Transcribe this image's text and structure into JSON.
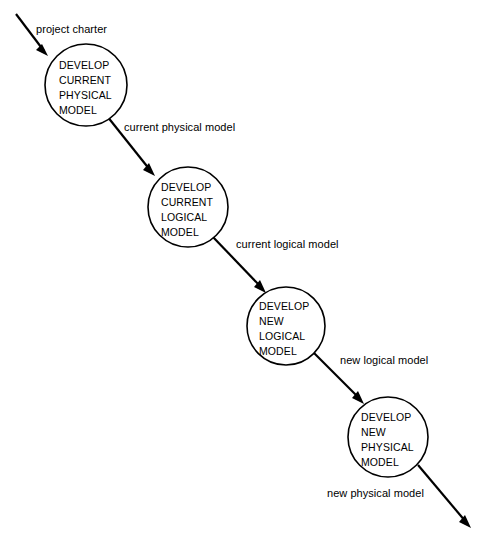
{
  "diagram": {
    "type": "data-flow-diagram",
    "background_color": "#ffffff",
    "stroke_color": "#000000",
    "processes": [
      {
        "id": "develop-current-physical-model",
        "lines": [
          "DEVELOP",
          "CURRENT",
          "PHYSICAL",
          "MODEL"
        ],
        "cx": 86,
        "cy": 85,
        "r": 41
      },
      {
        "id": "develop-current-logical-model",
        "lines": [
          "DEVELOP",
          "CURRENT",
          "LOGICAL",
          "MODEL"
        ],
        "cx": 188,
        "cy": 207,
        "r": 40
      },
      {
        "id": "develop-new-logical-model",
        "lines": [
          "DEVELOP",
          "NEW",
          "LOGICAL",
          "MODEL"
        ],
        "cx": 286,
        "cy": 326,
        "r": 39
      },
      {
        "id": "develop-new-physical-model",
        "lines": [
          "DEVELOP",
          "NEW",
          "PHYSICAL",
          "MODEL"
        ],
        "cx": 388,
        "cy": 437,
        "r": 40
      }
    ],
    "flows": [
      {
        "id": "project-charter",
        "label": "project charter",
        "label_x": 36,
        "label_y": 33,
        "x1": 16,
        "y1": 14,
        "x2": 48,
        "y2": 56
      },
      {
        "id": "current-physical-model",
        "label": "current physical model",
        "label_x": 124,
        "label_y": 131,
        "x1": 107,
        "y1": 116,
        "x2": 155,
        "y2": 176
      },
      {
        "id": "current-logical-model",
        "label": "current logical model",
        "label_x": 236,
        "label_y": 248,
        "x1": 212,
        "y1": 236,
        "x2": 266,
        "y2": 293
      },
      {
        "id": "new-logical-model",
        "label": "new logical model",
        "label_x": 340,
        "label_y": 364,
        "x1": 312,
        "y1": 351,
        "x2": 364,
        "y2": 404
      },
      {
        "id": "new-physical-model",
        "label": "new physical model",
        "label_x": 327,
        "label_y": 497,
        "x1": 418,
        "y1": 465,
        "x2": 471,
        "y2": 528
      }
    ]
  }
}
